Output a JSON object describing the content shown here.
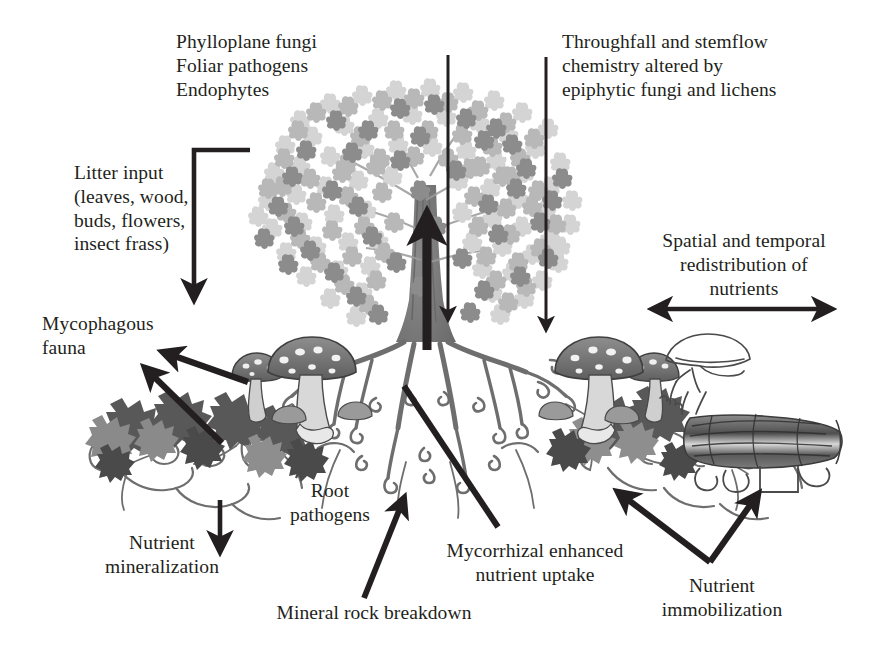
{
  "figure": {
    "background_color": "#ffffff",
    "text_color": "#231f20",
    "arrow_color": "#231f20"
  },
  "labels": {
    "canopy_fungi": "Phylloplane fungi\nFoliar pathogens\nEndophytes",
    "throughfall": "Throughfall and stemflow\nchemistry altered by\nepiphytic fungi and lichens",
    "litter_input": "Litter input\n(leaves, wood,\nbuds, flowers,\ninsect frass)",
    "mycophagous_fauna": "Mycophagous\nfauna",
    "nutrient_mineralization": "Nutrient\nmineralization",
    "root_pathogens": "Root\npathogens",
    "mineral_rock_breakdown": "Mineral rock breakdown",
    "mycorrhizal_uptake": "Mycorrhizal enhanced\nnutrient uptake",
    "nutrient_immobilization": "Nutrient\nimmobilization",
    "spatial_redistribution": "Spatial and temporal\nredistribution of\nnutrients"
  },
  "elements": {
    "tree": "tree-illustration",
    "canopy": "canopy-foliage",
    "trunk": "tree-trunk",
    "roots": "root-system",
    "mushrooms_left": "mushroom-cluster-left",
    "mushrooms_right": "mushroom-cluster-right",
    "mushroom_outline": "mushroom-outline-right",
    "log": "fallen-log",
    "litter_left": "leaf-litter-left",
    "litter_center": "leaf-litter-center",
    "litter_right": "leaf-litter-right",
    "mycelium": "mycelium-network"
  },
  "arrows": {
    "uptake_up": "nutrient-uptake-up-arrow",
    "throughfall_inner": "throughfall-arrow-inner",
    "throughfall_outer": "throughfall-arrow-outer",
    "litter_fall": "litter-input-arrow",
    "mineralization_down": "mineralization-down-arrow",
    "fauna_upper": "mycophagous-fauna-arrow-upper",
    "fauna_lower": "mycophagous-fauna-arrow-lower",
    "rock_breakdown_up": "mineral-rock-breakdown-arrow",
    "mycorrhizal_leader": "mycorrhizal-leader-line",
    "root_pathogen_leader": "root-pathogen-leader-line",
    "immobilization_left": "nutrient-immobilization-arrow-left",
    "immobilization_right": "nutrient-immobilization-arrow-right",
    "redistribution": "spatial-redistribution-double-arrow"
  },
  "palette": {
    "leaf_light": "#d2d2d2",
    "leaf_mid": "#b4b4b4",
    "leaf_dark": "#8e8e8e",
    "litter_dark": "#5a5a5a",
    "litter_mid": "#808080",
    "root": "#6e6e6e",
    "mushroom_cap": "#7a7a7a",
    "mushroom_stem": "#cfcfcf",
    "log_dark": "#555555",
    "ink": "#231f20"
  }
}
